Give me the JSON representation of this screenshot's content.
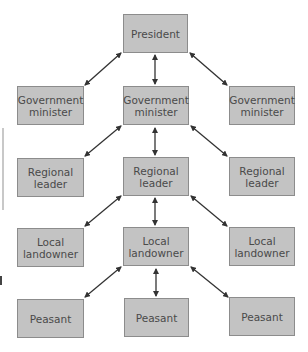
{
  "diagram": {
    "type": "hierarchy",
    "nodes": {
      "president": {
        "line1": "President",
        "line2": ""
      },
      "minister_left": {
        "line1": "Government",
        "line2": "minister"
      },
      "minister_center": {
        "line1": "Government",
        "line2": "minister"
      },
      "minister_right": {
        "line1": "Government",
        "line2": "minister"
      },
      "regional_left": {
        "line1": "Regional",
        "line2": "leader"
      },
      "regional_center": {
        "line1": "Regional",
        "line2": "leader"
      },
      "regional_right": {
        "line1": "Regional",
        "line2": "leader"
      },
      "local_left": {
        "line1": "Local",
        "line2": "landowner"
      },
      "local_center": {
        "line1": "Local",
        "line2": "landowner"
      },
      "local_right": {
        "line1": "Local",
        "line2": "landowner"
      },
      "peasant_left": {
        "line1": "Peasant",
        "line2": ""
      },
      "peasant_center": {
        "line1": "Peasant",
        "line2": ""
      },
      "peasant_right": {
        "line1": "Peasant",
        "line2": ""
      }
    },
    "edges": [
      {
        "from": "president",
        "to": "minister_left",
        "bidirectional": true
      },
      {
        "from": "president",
        "to": "minister_center",
        "bidirectional": true
      },
      {
        "from": "president",
        "to": "minister_right",
        "bidirectional": true
      },
      {
        "from": "minister_center",
        "to": "regional_left",
        "bidirectional": true
      },
      {
        "from": "minister_center",
        "to": "regional_center",
        "bidirectional": true
      },
      {
        "from": "minister_center",
        "to": "regional_right",
        "bidirectional": true
      },
      {
        "from": "regional_center",
        "to": "local_left",
        "bidirectional": true
      },
      {
        "from": "regional_center",
        "to": "local_center",
        "bidirectional": true
      },
      {
        "from": "regional_center",
        "to": "local_right",
        "bidirectional": true
      },
      {
        "from": "local_center",
        "to": "peasant_left",
        "bidirectional": true
      },
      {
        "from": "local_center",
        "to": "peasant_center",
        "bidirectional": true
      },
      {
        "from": "local_center",
        "to": "peasant_right",
        "bidirectional": true
      }
    ],
    "colors": {
      "node_fill": "#c3c3c3",
      "node_border": "#8c8c8c",
      "arrow": "#333333",
      "text": "#4a4a4a"
    }
  }
}
